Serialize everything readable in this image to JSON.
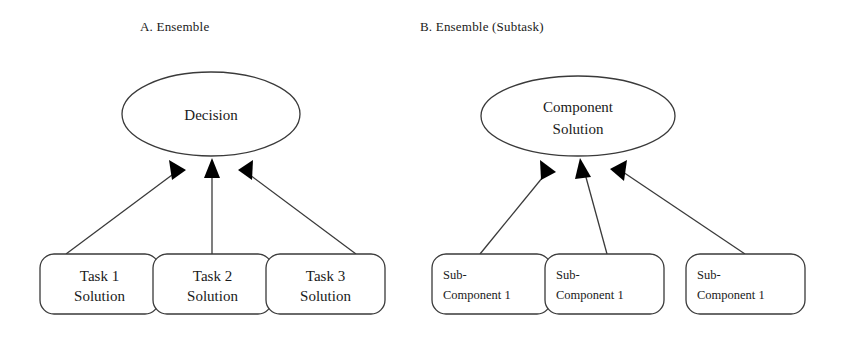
{
  "figure": {
    "background_color": "#ffffff",
    "stroke_color": "#3a3a3a",
    "text_color": "#1a1a1a",
    "arrow_fill": "#000000"
  },
  "panels": [
    {
      "id": "panel-a",
      "title": "A. Ensemble",
      "root": {
        "shape": "ellipse",
        "lines": [
          "Decision"
        ]
      },
      "leaves": [
        {
          "shape": "rounded-rect",
          "align": "center",
          "lines": [
            "Task 1",
            "Solution"
          ]
        },
        {
          "shape": "rounded-rect",
          "align": "center",
          "lines": [
            "Task 2",
            "Solution"
          ]
        },
        {
          "shape": "rounded-rect",
          "align": "center",
          "lines": [
            "Task 3",
            "Solution"
          ]
        }
      ]
    },
    {
      "id": "panel-b",
      "title": "B. Ensemble (Subtask)",
      "root": {
        "shape": "ellipse",
        "lines": [
          "Component",
          "Solution"
        ]
      },
      "leaves": [
        {
          "shape": "rounded-rect",
          "align": "left",
          "lines": [
            "Sub-",
            "Component 1"
          ]
        },
        {
          "shape": "rounded-rect",
          "align": "left",
          "lines": [
            "Sub-",
            "Component 1"
          ]
        },
        {
          "shape": "rounded-rect",
          "align": "left",
          "lines": [
            "Sub-",
            "Component 1"
          ]
        }
      ]
    }
  ],
  "edges": {
    "count_per_panel": 3,
    "direction": "leaf-to-root",
    "arrowhead": "filled-triangle"
  }
}
